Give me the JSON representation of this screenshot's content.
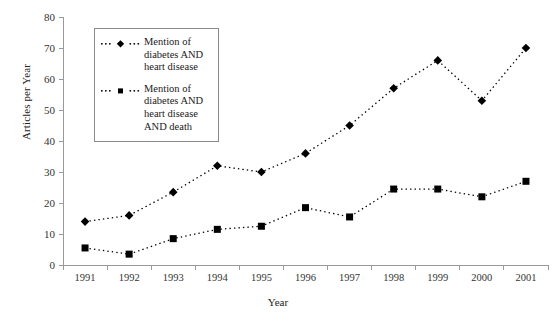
{
  "chart_data": {
    "type": "line",
    "title": "",
    "xlabel": "Year",
    "ylabel": "Articles per Year",
    "categories": [
      "1991",
      "1992",
      "1993",
      "1994",
      "1995",
      "1996",
      "1997",
      "1998",
      "1999",
      "2000",
      "2001"
    ],
    "x": [
      1991,
      1992,
      1993,
      1994,
      1995,
      1996,
      1997,
      1998,
      1999,
      2000,
      2001
    ],
    "xlim": [
      1990.5,
      2001.5
    ],
    "ylim": [
      0,
      80
    ],
    "yticks": [
      0,
      10,
      20,
      30,
      40,
      50,
      60,
      70,
      80
    ],
    "grid": false,
    "legend_position": "upper-left-inside",
    "series": [
      {
        "name": "Mention of diabetes AND heart disease",
        "marker": "diamond",
        "linestyle": "dotted",
        "color": "#000000",
        "values": [
          14,
          16,
          23.5,
          32,
          30,
          36,
          45,
          57,
          66,
          53,
          70
        ]
      },
      {
        "name": "Mention of diabetes AND heart disease AND death",
        "marker": "square",
        "linestyle": "dotted",
        "color": "#000000",
        "values": [
          5.5,
          3.5,
          8.5,
          11.5,
          12.5,
          18.5,
          15.5,
          24.5,
          24.5,
          22,
          27
        ]
      }
    ]
  },
  "legend": {
    "entries": [
      {
        "line1": "Mention of",
        "line2": "diabetes AND",
        "line3": "heart disease",
        "line4": ""
      },
      {
        "line1": "Mention of",
        "line2": "diabetes AND",
        "line3": "heart disease",
        "line4": "AND death"
      }
    ]
  },
  "axes": {
    "y_title": "Articles per Year",
    "x_title": "Year",
    "y_labels": [
      "0",
      "10",
      "20",
      "30",
      "40",
      "50",
      "60",
      "70",
      "80"
    ],
    "x_labels": [
      "1991",
      "1992",
      "1993",
      "1994",
      "1995",
      "1996",
      "1997",
      "1998",
      "1999",
      "2000",
      "2001"
    ]
  },
  "colors": {
    "axis": "#9a9a9a",
    "marker": "#000000",
    "text": "#1a1a1a",
    "legend_border": "#8a8a8a",
    "background": "#ffffff"
  }
}
